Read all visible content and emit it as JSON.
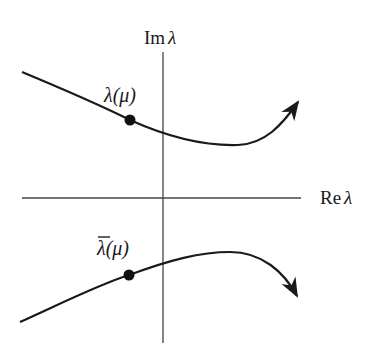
{
  "diagram": {
    "type": "complex-plane-eigenvalue-paths",
    "axes": {
      "imaginary_label": "Im λ",
      "real_label": "Re λ"
    },
    "curves": [
      {
        "name": "upper-eigenvalue-path",
        "label": "λ(μ)",
        "direction": "arrow up-right"
      },
      {
        "name": "lower-conjugate-eigenvalue-path",
        "label": "λ̄(μ)",
        "direction": "arrow down-right"
      }
    ],
    "colors": {
      "ink": "#1a1a1a",
      "axis": "#333333",
      "background": "#ffffff"
    }
  },
  "labels": {
    "im_prefix": "Im",
    "re_prefix": "Re",
    "lambda": "λ",
    "upper_curve": "λ(μ)",
    "lower_lambda": "λ",
    "lower_args": "(μ)"
  }
}
